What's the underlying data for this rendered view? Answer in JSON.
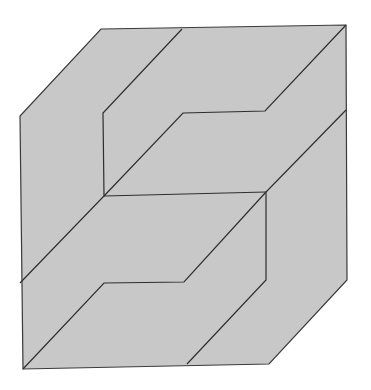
{
  "figure": {
    "fill_color": "#c8c8c8",
    "stroke_color": "#3a3a3a",
    "background": "#ffffff",
    "outline": "101,29 346,25 347,280 269,364 23,369 20,116",
    "lines": [
      "182,29 103,113 104,196 20,283",
      "346,25 265,111 183,113 104,196",
      "104,196 266,192",
      "346,110 266,192 266,280 187,364",
      "266,192 184,282 104,283 23,369"
    ]
  }
}
